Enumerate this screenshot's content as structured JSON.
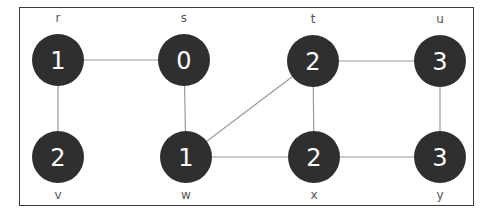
{
  "diagram": {
    "type": "graph",
    "colors": {
      "node_fill": "#2f2f2f",
      "edge": "#9a9a9a",
      "text": "#ffffff",
      "label": "#555555",
      "frame": "#3a3a3a"
    },
    "nodes": [
      {
        "id": "r",
        "label": "r",
        "value": "1",
        "x": 58,
        "y": 60,
        "label_pos": "above"
      },
      {
        "id": "s",
        "label": "s",
        "value": "0",
        "x": 184,
        "y": 60,
        "label_pos": "above"
      },
      {
        "id": "t",
        "label": "t",
        "value": "2",
        "x": 313,
        "y": 61,
        "label_pos": "above"
      },
      {
        "id": "u",
        "label": "u",
        "value": "3",
        "x": 440,
        "y": 61,
        "label_pos": "above"
      },
      {
        "id": "v",
        "label": "v",
        "value": "2",
        "x": 58,
        "y": 157,
        "label_pos": "below"
      },
      {
        "id": "w",
        "label": "w",
        "value": "1",
        "x": 186,
        "y": 157,
        "label_pos": "below"
      },
      {
        "id": "x",
        "label": "x",
        "value": "2",
        "x": 314,
        "y": 157,
        "label_pos": "below"
      },
      {
        "id": "y",
        "label": "y",
        "value": "3",
        "x": 440,
        "y": 157,
        "label_pos": "below"
      }
    ],
    "edges": [
      [
        "r",
        "s"
      ],
      [
        "r",
        "v"
      ],
      [
        "s",
        "w"
      ],
      [
        "w",
        "t"
      ],
      [
        "w",
        "x"
      ],
      [
        "t",
        "x"
      ],
      [
        "t",
        "u"
      ],
      [
        "x",
        "y"
      ],
      [
        "u",
        "y"
      ]
    ]
  }
}
